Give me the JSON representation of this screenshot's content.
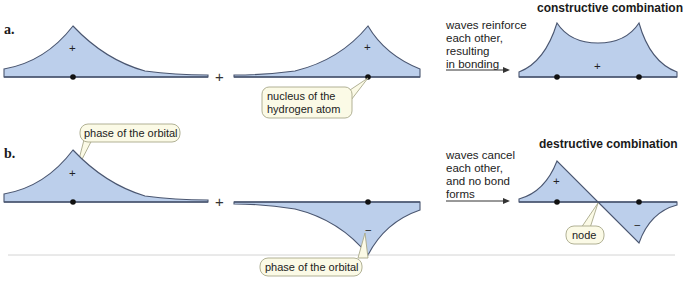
{
  "figure": {
    "part_a": {
      "label": "a.",
      "operator": "+",
      "orbital_sign_left": "+",
      "orbital_sign_middle": "+",
      "orbital_sign_result": "+",
      "arrow_text": [
        "waves reinforce",
        "each other,",
        "resulting",
        "in bonding"
      ],
      "result_title": "constructive combination",
      "callout": [
        "nucleus of the",
        "hydrogen atom"
      ]
    },
    "part_b": {
      "label": "b.",
      "operator": "+",
      "orbital_sign_left": "+",
      "orbital_sign_middle": "−",
      "orbital_sign_result_pos": "+",
      "orbital_sign_result_neg": "−",
      "arrow_text": [
        "waves cancel",
        "each other,",
        "and no bond",
        "forms"
      ],
      "result_title": "destructive combination",
      "callout_top": "phase of the orbital",
      "callout_bottom": "phase of the orbital",
      "callout_node": "node"
    },
    "colors": {
      "orbital_fill": "#bccfeb",
      "orbital_stroke": "#4a5670",
      "callout_fill": "#fbfae6",
      "callout_stroke": "#a8a88a"
    }
  }
}
